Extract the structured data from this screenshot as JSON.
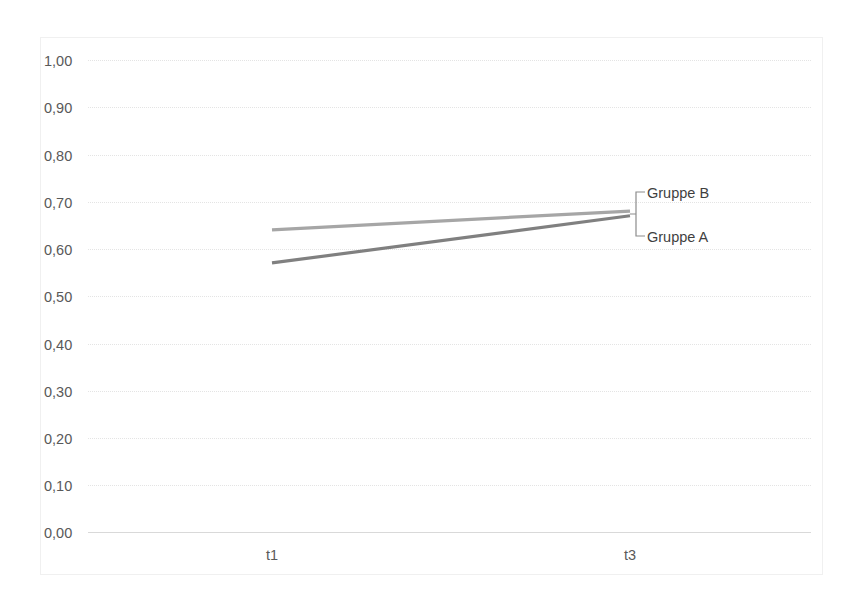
{
  "chart_data": {
    "type": "line",
    "title": "",
    "xlabel": "",
    "ylabel": "",
    "x": [
      "t1",
      "t3"
    ],
    "categories": [
      "t1",
      "t3"
    ],
    "series": [
      {
        "name": "Gruppe B",
        "values": [
          0.64,
          0.68
        ],
        "color": "#a6a6a6"
      },
      {
        "name": "Gruppe A",
        "values": [
          0.57,
          0.67
        ],
        "color": "#808080"
      }
    ],
    "ylim": [
      0.0,
      1.0
    ],
    "ytick_labels": [
      "1,00",
      "0,90",
      "0,80",
      "0,70",
      "0,60",
      "0,50",
      "0,40",
      "0,30",
      "0,20",
      "0,10",
      "0,00"
    ],
    "ytick_values": [
      1.0,
      0.9,
      0.8,
      0.7,
      0.6,
      0.5,
      0.4,
      0.3,
      0.2,
      0.1,
      0.0
    ],
    "xtick_labels": [
      "t1",
      "t3"
    ],
    "grid": true,
    "legend_position": "inline-right-leader",
    "legend_entries": [
      "Gruppe B",
      "Gruppe A"
    ],
    "annotations": [
      {
        "text": "Gruppe B",
        "target_series": "Gruppe B"
      },
      {
        "text": "Gruppe A",
        "target_series": "Gruppe A"
      }
    ]
  },
  "colors": {
    "background": "#ffffff",
    "frame": "#f0f0f0",
    "gridline": "#e4e4e4",
    "axis": "#d9d9d9",
    "tick_text": "#595959",
    "label_text": "#3f3f3f",
    "series_b": "#a6a6a6",
    "series_a": "#808080",
    "leader": "#8c8c8c"
  }
}
